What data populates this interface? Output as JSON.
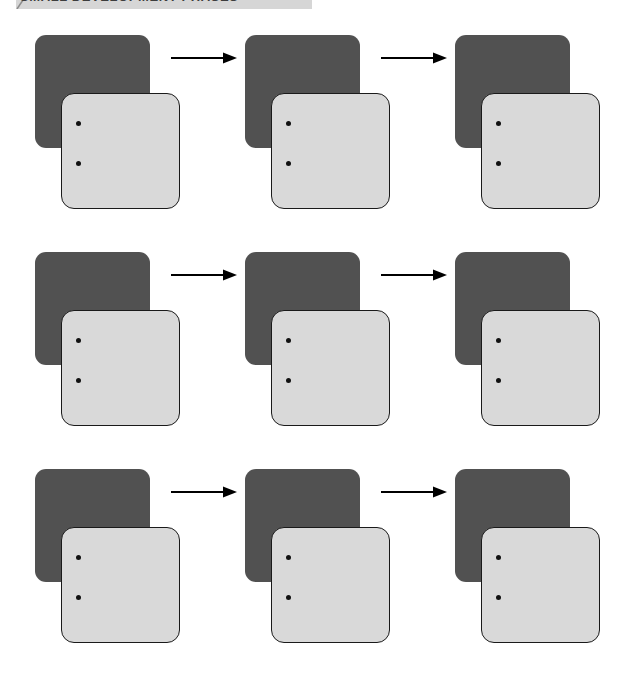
{
  "page": {
    "background_color": "#ffffff",
    "width": 635,
    "height": 673
  },
  "header": {
    "title": "SMALL DEVELOPMENT PHASES",
    "banner_color": "#d6d6d6",
    "text_color": "#3d3d3d",
    "corner_mark_icon": "diagonal-slash-icon",
    "cropped": "true"
  },
  "diagram": {
    "type": "grid-of-process-steps",
    "rows": 3,
    "columns": 3,
    "colors": {
      "back_card": "#515151",
      "front_card": "#d9d9d9",
      "card_outline": "#1a1a1a",
      "dot": "#111111",
      "arrow": "#000000"
    },
    "cells": [
      {
        "row": 1,
        "column": 1,
        "back_card_label": "",
        "front_card_label": "",
        "dots": [
          "",
          ""
        ],
        "arrow_after": "arrow-right-icon"
      },
      {
        "row": 1,
        "column": 2,
        "back_card_label": "",
        "front_card_label": "",
        "dots": [
          "",
          ""
        ],
        "arrow_after": "arrow-right-icon"
      },
      {
        "row": 1,
        "column": 3,
        "back_card_label": "",
        "front_card_label": "",
        "dots": [
          "",
          ""
        ],
        "arrow_after": ""
      },
      {
        "row": 2,
        "column": 1,
        "back_card_label": "",
        "front_card_label": "",
        "dots": [
          "",
          ""
        ],
        "arrow_after": "arrow-right-icon"
      },
      {
        "row": 2,
        "column": 2,
        "back_card_label": "",
        "front_card_label": "",
        "dots": [
          "",
          ""
        ],
        "arrow_after": "arrow-right-icon"
      },
      {
        "row": 2,
        "column": 3,
        "back_card_label": "",
        "front_card_label": "",
        "dots": [
          "",
          ""
        ],
        "arrow_after": ""
      },
      {
        "row": 3,
        "column": 1,
        "back_card_label": "",
        "front_card_label": "",
        "dots": [
          "",
          ""
        ],
        "arrow_after": "arrow-right-icon"
      },
      {
        "row": 3,
        "column": 2,
        "back_card_label": "",
        "front_card_label": "",
        "dots": [
          "",
          ""
        ],
        "arrow_after": "arrow-right-icon"
      },
      {
        "row": 3,
        "column": 3,
        "back_card_label": "",
        "front_card_label": "",
        "dots": [
          "",
          ""
        ],
        "arrow_after": ""
      }
    ]
  }
}
